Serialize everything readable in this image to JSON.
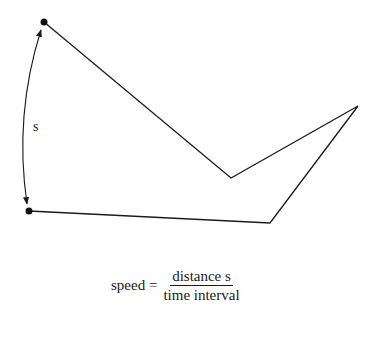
{
  "diagram": {
    "distance_label": "s",
    "points": {
      "start": [
        44,
        22
      ],
      "v_vertex": [
        231,
        178
      ],
      "right_tip": [
        358,
        106
      ],
      "bottom_right": [
        270,
        223
      ],
      "end": [
        29,
        211
      ]
    },
    "line_color": "#1a1a1a"
  },
  "formula": {
    "lhs": "speed =",
    "numerator": "distance s",
    "denominator": "time interval"
  }
}
